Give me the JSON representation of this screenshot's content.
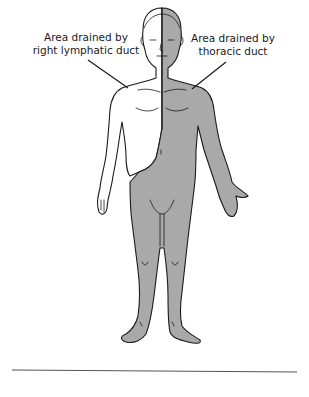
{
  "figure": {
    "labels": {
      "right_lymphatic": {
        "line1": "Area drained by",
        "line2": "right lymphatic duct"
      },
      "thoracic": {
        "line1": "Area drained by",
        "line2": "thoracic duct"
      }
    },
    "colors": {
      "shaded_region": "#a9a9a9",
      "unshaded_region": "#ffffff",
      "outline": "#1a1a1a",
      "rule": "#555555"
    }
  }
}
